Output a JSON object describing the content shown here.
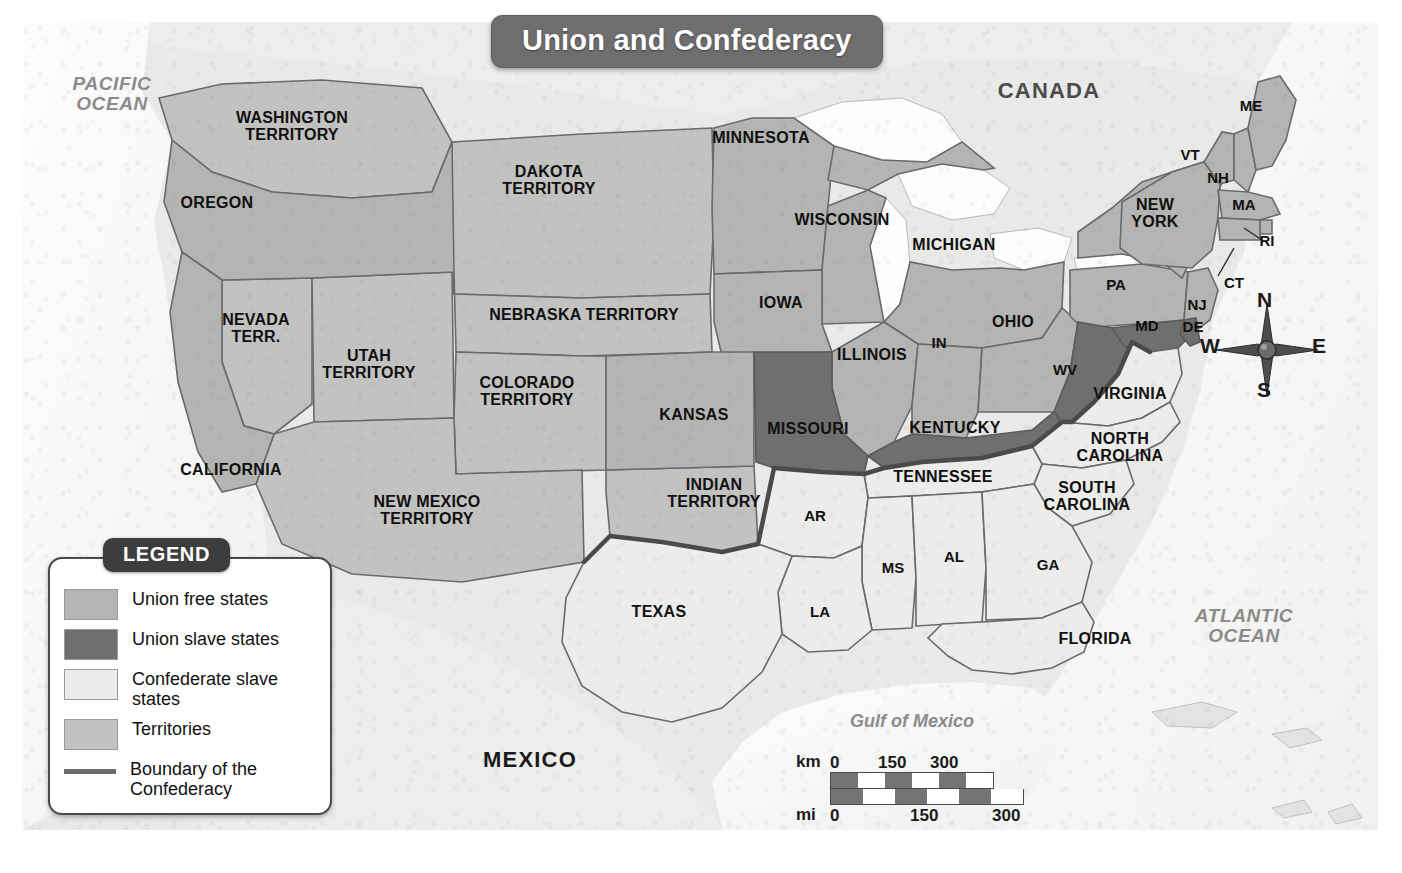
{
  "title": {
    "text": "Union and Confederacy"
  },
  "legend": {
    "heading": "LEGEND",
    "items": [
      {
        "label": "Union free states",
        "swatch": "#b4b4b2",
        "kind": "fill"
      },
      {
        "label": "Union slave states",
        "swatch": "#6f6f6f",
        "kind": "fill"
      },
      {
        "label": "Confederate slave\nstates",
        "swatch": "#ececeb",
        "kind": "fill"
      },
      {
        "label": "Territories",
        "swatch": "#c2c2c0",
        "kind": "fill"
      },
      {
        "label": "Boundary of the\nConfederacy",
        "swatch": "#6d6d6d",
        "kind": "line"
      }
    ]
  },
  "compass": {
    "north": "N",
    "east": "E",
    "south": "S",
    "west": "W"
  },
  "scale": {
    "km_unit": "km",
    "mi_unit": "mi",
    "km_ticks": [
      "0",
      "150",
      "300"
    ],
    "mi_ticks": [
      "0",
      "150",
      "300"
    ]
  },
  "water_labels": [
    {
      "name": "pacific-ocean",
      "text": "PACIFIC\nOCEAN",
      "x": 90,
      "y": 72,
      "cls": "ocean"
    },
    {
      "name": "atlantic-ocean",
      "text": "ATLANTIC\nOCEAN",
      "x": 1222,
      "y": 604,
      "cls": "ocean"
    },
    {
      "name": "gulf-of-mexico",
      "text": "Gulf of Mexico",
      "x": 890,
      "y": 700,
      "cls": "gulf"
    }
  ],
  "country_labels": [
    {
      "name": "canada",
      "text": "CANADA",
      "x": 1027,
      "y": 69,
      "cls": "country"
    },
    {
      "name": "mexico",
      "text": "MEXICO",
      "x": 508,
      "y": 738,
      "cls": "mexico"
    }
  ],
  "state_labels": [
    {
      "name": "washington-territory",
      "text": "WASHINGTON\nTERRITORY",
      "x": 270,
      "y": 105,
      "cls": "terr",
      "category": "territory"
    },
    {
      "name": "oregon",
      "text": "OREGON",
      "x": 195,
      "y": 181,
      "cls": "state",
      "category": "union-free"
    },
    {
      "name": "dakota-territory",
      "text": "DAKOTA\nTERRITORY",
      "x": 527,
      "y": 159,
      "cls": "terr",
      "category": "territory"
    },
    {
      "name": "minnesota",
      "text": "MINNESOTA",
      "x": 739,
      "y": 116,
      "cls": "state",
      "category": "union-free"
    },
    {
      "name": "wisconsin",
      "text": "WISCONSIN",
      "x": 820,
      "y": 198,
      "cls": "state",
      "category": "union-free"
    },
    {
      "name": "michigan",
      "text": "MICHIGAN",
      "x": 932,
      "y": 223,
      "cls": "state",
      "category": "union-free"
    },
    {
      "name": "iowa",
      "text": "IOWA",
      "x": 759,
      "y": 281,
      "cls": "state",
      "category": "union-free"
    },
    {
      "name": "nevada-territory",
      "text": "NEVADA\nTERR.",
      "x": 234,
      "y": 307,
      "cls": "terr",
      "category": "territory"
    },
    {
      "name": "utah-territory",
      "text": "UTAH\nTERRITORY",
      "x": 347,
      "y": 343,
      "cls": "terr",
      "category": "territory"
    },
    {
      "name": "nebraska-territory",
      "text": "NEBRASKA TERRITORY",
      "x": 562,
      "y": 293,
      "cls": "terr",
      "category": "territory"
    },
    {
      "name": "colorado-territory",
      "text": "COLORADO\nTERRITORY",
      "x": 505,
      "y": 370,
      "cls": "terr",
      "category": "territory"
    },
    {
      "name": "kansas",
      "text": "KANSAS",
      "x": 672,
      "y": 393,
      "cls": "state",
      "category": "union-free"
    },
    {
      "name": "illinois",
      "text": "ILLINOIS",
      "x": 850,
      "y": 333,
      "cls": "state",
      "category": "union-free"
    },
    {
      "name": "indiana",
      "text": "IN",
      "x": 917,
      "y": 321,
      "cls": "small",
      "category": "union-free"
    },
    {
      "name": "ohio",
      "text": "OHIO",
      "x": 991,
      "y": 300,
      "cls": "state",
      "category": "union-free"
    },
    {
      "name": "pennsylvania",
      "text": "PA",
      "x": 1094,
      "y": 263,
      "cls": "small",
      "category": "union-free"
    },
    {
      "name": "new-york",
      "text": "NEW\nYORK",
      "x": 1133,
      "y": 192,
      "cls": "state",
      "category": "union-free"
    },
    {
      "name": "vermont",
      "text": "VT",
      "x": 1168,
      "y": 133,
      "cls": "small",
      "category": "union-free"
    },
    {
      "name": "new-hampshire",
      "text": "NH",
      "x": 1196,
      "y": 156,
      "cls": "small",
      "category": "union-free"
    },
    {
      "name": "maine",
      "text": "ME",
      "x": 1229,
      "y": 84,
      "cls": "small",
      "category": "union-free"
    },
    {
      "name": "massachusetts",
      "text": "MA",
      "x": 1222,
      "y": 183,
      "cls": "small",
      "category": "union-free"
    },
    {
      "name": "rhode-island",
      "text": "RI",
      "x": 1245,
      "y": 219,
      "cls": "small",
      "category": "union-free"
    },
    {
      "name": "connecticut",
      "text": "CT",
      "x": 1212,
      "y": 261,
      "cls": "small",
      "category": "union-free"
    },
    {
      "name": "new-jersey",
      "text": "NJ",
      "x": 1175,
      "y": 283,
      "cls": "small",
      "category": "union-free"
    },
    {
      "name": "delaware",
      "text": "DE",
      "x": 1171,
      "y": 305,
      "cls": "small",
      "category": "union-slave"
    },
    {
      "name": "maryland",
      "text": "MD",
      "x": 1125,
      "y": 304,
      "cls": "small",
      "category": "union-slave"
    },
    {
      "name": "west-virginia",
      "text": "WV",
      "x": 1043,
      "y": 348,
      "cls": "small",
      "category": "union-slave"
    },
    {
      "name": "virginia",
      "text": "VIRGINIA",
      "x": 1108,
      "y": 372,
      "cls": "state",
      "category": "confederate"
    },
    {
      "name": "kentucky",
      "text": "KENTUCKY",
      "x": 933,
      "y": 406,
      "cls": "state",
      "category": "union-slave"
    },
    {
      "name": "missouri",
      "text": "MISSOURI",
      "x": 786,
      "y": 407,
      "cls": "state",
      "category": "union-slave"
    },
    {
      "name": "tennessee",
      "text": "TENNESSEE",
      "x": 921,
      "y": 455,
      "cls": "state",
      "category": "confederate"
    },
    {
      "name": "north-carolina",
      "text": "NORTH\nCAROLINA",
      "x": 1098,
      "y": 426,
      "cls": "state",
      "category": "confederate"
    },
    {
      "name": "south-carolina",
      "text": "SOUTH\nCAROLINA",
      "x": 1065,
      "y": 475,
      "cls": "state",
      "category": "confederate"
    },
    {
      "name": "indian-territory",
      "text": "INDIAN\nTERRITORY",
      "x": 692,
      "y": 472,
      "cls": "terr",
      "category": "territory"
    },
    {
      "name": "arkansas",
      "text": "AR",
      "x": 793,
      "y": 494,
      "cls": "small",
      "category": "confederate"
    },
    {
      "name": "mississippi",
      "text": "MS",
      "x": 871,
      "y": 546,
      "cls": "small",
      "category": "confederate"
    },
    {
      "name": "alabama",
      "text": "AL",
      "x": 932,
      "y": 535,
      "cls": "small",
      "category": "confederate"
    },
    {
      "name": "georgia",
      "text": "GA",
      "x": 1026,
      "y": 543,
      "cls": "small",
      "category": "confederate"
    },
    {
      "name": "louisiana",
      "text": "LA",
      "x": 798,
      "y": 590,
      "cls": "small",
      "category": "confederate"
    },
    {
      "name": "florida",
      "text": "FLORIDA",
      "x": 1073,
      "y": 617,
      "cls": "state",
      "category": "confederate"
    },
    {
      "name": "texas",
      "text": "TEXAS",
      "x": 637,
      "y": 590,
      "cls": "state",
      "category": "confederate"
    },
    {
      "name": "new-mexico-territory",
      "text": "NEW MEXICO\nTERRITORY",
      "x": 405,
      "y": 489,
      "cls": "terr",
      "category": "territory"
    },
    {
      "name": "california",
      "text": "CALIFORNIA",
      "x": 209,
      "y": 448,
      "cls": "state",
      "category": "union-free"
    }
  ],
  "colors": {
    "union_free": "#b4b4b2",
    "union_slave": "#6f6f6f",
    "confederate": "#ececeb",
    "territory": "#c2c2c0",
    "water": "#fbfbfb",
    "land_other": "#ededeb",
    "border": "#6a6a6a",
    "confed_line": "#4a4a4a"
  }
}
